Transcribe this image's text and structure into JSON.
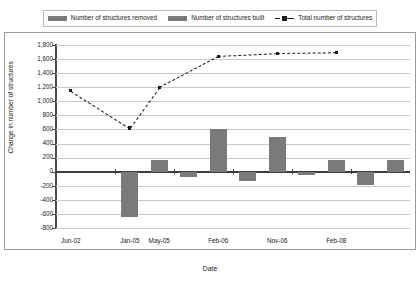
{
  "chart_data": {
    "type": "bar",
    "title": "",
    "xlabel": "Date",
    "ylabel": "Change in number of structures",
    "ylim": [
      -800,
      1800
    ],
    "ytick_step": 200,
    "grid": true,
    "legend_position": "top",
    "ytick_labels": [
      "1,800",
      "1,600",
      "1,400",
      "1,200",
      "1,000",
      "800",
      "600",
      "400",
      "200",
      "0",
      "-200",
      "-400",
      "-600",
      "-800"
    ],
    "ytick_values": [
      1800,
      1600,
      1400,
      1200,
      1000,
      800,
      600,
      400,
      200,
      0,
      -200,
      -400,
      -600,
      -800
    ],
    "xtick_labels": [
      "Jun-02",
      "Jan-05",
      "May-05",
      "Feb-06",
      "Nov-06",
      "Feb-08"
    ],
    "categories": [
      "Jun-02",
      "",
      "Jan-05",
      "May-05",
      "",
      "Feb-06",
      "",
      "Nov-06",
      "",
      "Feb-08",
      "",
      ""
    ],
    "series": [
      {
        "name": "Number of structures removed",
        "color": "#7a7a7a",
        "values": [
          0,
          0,
          -650,
          0,
          -80,
          0,
          -130,
          0,
          -40,
          0,
          -190,
          0
        ]
      },
      {
        "name": "Number of structures built",
        "color": "#7a7a7a",
        "values": [
          0,
          0,
          0,
          170,
          0,
          600,
          0,
          500,
          0,
          170,
          0,
          160
        ]
      },
      {
        "name": "Total number of structures",
        "color": "#1a1a1a",
        "style": "dashed-line-with-square-markers",
        "x": [
          "Jun-02",
          "Jan-05",
          "May-05",
          "Feb-06",
          "Nov-06",
          "Feb-08"
        ],
        "values": [
          1150,
          620,
          1200,
          1640,
          1680,
          1690
        ]
      }
    ]
  },
  "legend": {
    "items": [
      {
        "label": "Number of structures removed",
        "icon": "bar-swatch"
      },
      {
        "label": "Number of structures built",
        "icon": "bar-swatch"
      },
      {
        "label": "Total number of structures",
        "icon": "dashed-line-marker"
      }
    ]
  }
}
